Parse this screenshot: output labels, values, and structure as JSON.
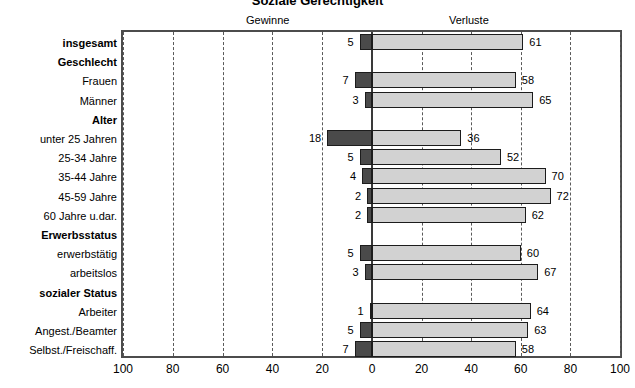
{
  "chart_data": {
    "type": "bar",
    "title": "Soziale Gerechtigkeit",
    "orientation": "horizontal",
    "layout": "diverging",
    "xlabel": "",
    "ylabel": "",
    "xlim": [
      -100,
      100
    ],
    "grid": true,
    "gridlines_every": 20,
    "legend_position": "top",
    "axis_left_title": "Gewinne",
    "axis_right_title": "Verluste",
    "x_tick_labels": [
      "100",
      "80",
      "60",
      "40",
      "20",
      "0",
      "20",
      "40",
      "60",
      "80",
      "100"
    ],
    "x_tick_values": [
      -100,
      -80,
      -60,
      -40,
      -20,
      0,
      20,
      40,
      60,
      80,
      100
    ],
    "series": [
      {
        "name": "Gewinne",
        "color": "#4a4a4a",
        "direction": "left"
      },
      {
        "name": "Verluste",
        "color": "#d2d2d2",
        "direction": "right"
      }
    ],
    "categories": [
      "insgesamt",
      "Geschlecht",
      "Frauen",
      "Männer",
      "Alter",
      "unter 25 Jahren",
      "25-34 Jahre",
      "35-44 Jahre",
      "45-59 Jahre",
      "60 Jahre u.dar.",
      "Erwerbsstatus",
      "erwerbstätig",
      "arbeitslos",
      "sozialer Status",
      "Arbeiter",
      "Angest./Beamter",
      "Selbst./Freischaff."
    ],
    "rows": [
      {
        "label": "insgesamt",
        "group": true,
        "gewinne": 5,
        "verluste": 61
      },
      {
        "label": "Geschlecht",
        "group": true,
        "gewinne": null,
        "verluste": null
      },
      {
        "label": "Frauen",
        "group": false,
        "gewinne": 7,
        "verluste": 58
      },
      {
        "label": "Männer",
        "group": false,
        "gewinne": 3,
        "verluste": 65
      },
      {
        "label": "Alter",
        "group": true,
        "gewinne": null,
        "verluste": null
      },
      {
        "label": "unter 25 Jahren",
        "group": false,
        "gewinne": 18,
        "verluste": 36
      },
      {
        "label": "25-34 Jahre",
        "group": false,
        "gewinne": 5,
        "verluste": 52
      },
      {
        "label": "35-44 Jahre",
        "group": false,
        "gewinne": 4,
        "verluste": 70
      },
      {
        "label": "45-59 Jahre",
        "group": false,
        "gewinne": 2,
        "verluste": 72
      },
      {
        "label": "60 Jahre u.dar.",
        "group": false,
        "gewinne": 2,
        "verluste": 62
      },
      {
        "label": "Erwerbsstatus",
        "group": true,
        "gewinne": null,
        "verluste": null
      },
      {
        "label": "erwerbstätig",
        "group": false,
        "gewinne": 5,
        "verluste": 60
      },
      {
        "label": "arbeitslos",
        "group": false,
        "gewinne": 3,
        "verluste": 67
      },
      {
        "label": "sozialer Status",
        "group": true,
        "gewinne": null,
        "verluste": null
      },
      {
        "label": "Arbeiter",
        "group": false,
        "gewinne": 1,
        "verluste": 64
      },
      {
        "label": "Angest./Beamter",
        "group": false,
        "gewinne": 5,
        "verluste": 63
      },
      {
        "label": "Selbst./Freischaff.",
        "group": false,
        "gewinne": 7,
        "verluste": 58
      }
    ]
  }
}
